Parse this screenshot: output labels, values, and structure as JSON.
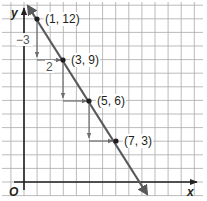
{
  "graph": {
    "axes": {
      "x_label": "x",
      "y_label": "y",
      "origin_label": "O"
    },
    "grid": {
      "x_min": 0,
      "x_max": 13,
      "y_min": 0,
      "y_max": 13,
      "cell_px_x": 13.1,
      "cell_px_y": 13.6,
      "origin_px": [
        24,
        182
      ]
    },
    "colors": {
      "grid": "#aaaaaa",
      "line": "#58595b",
      "axis": "#231f20",
      "arrows": "#6d6e71",
      "text": "#231f20"
    },
    "points": [
      {
        "x": 1,
        "y": 12,
        "label": "(1, 12)"
      },
      {
        "x": 3,
        "y": 9,
        "label": "(3, 9)"
      },
      {
        "x": 5,
        "y": 6,
        "label": "(5, 6)"
      },
      {
        "x": 7,
        "y": 3,
        "label": "(7, 3)"
      }
    ],
    "annotations": {
      "rise_label": "−3",
      "run_label": "2"
    }
  },
  "chart_data": {
    "type": "line",
    "title": "",
    "xlabel": "x",
    "ylabel": "y",
    "x": [
      1,
      3,
      5,
      7
    ],
    "y": [
      12,
      9,
      6,
      3
    ],
    "point_labels": [
      "(1, 12)",
      "(3, 9)",
      "(5, 6)",
      "(7, 3)"
    ],
    "slope_annotations": {
      "rise": -3,
      "run": 2
    },
    "xlim": [
      0,
      13
    ],
    "ylim": [
      0,
      13
    ],
    "grid": true
  }
}
